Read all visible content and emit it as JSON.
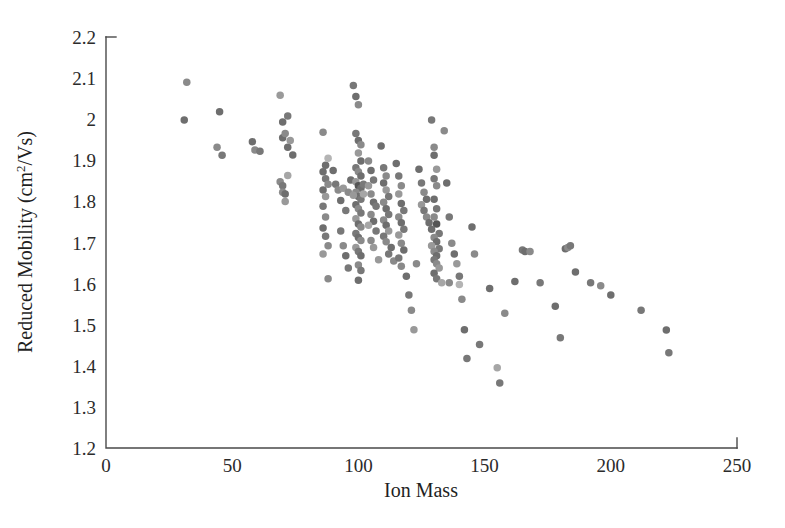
{
  "figure": {
    "background_color": "#ffffff",
    "axis_color": "#4a4a4a",
    "text_color": "#1f1f1f"
  },
  "chart_data": {
    "type": "scatter",
    "title": "",
    "xlabel": "Ion Mass",
    "ylabel": "Reduced Mobility (cm2/Vs)",
    "ylabel_parts": {
      "prefix": "Reduced Mobility (cm",
      "superscript": "2",
      "suffix": "/Vs)"
    },
    "xlim": [
      0,
      250
    ],
    "ylim": [
      1.2,
      2.2
    ],
    "xticks": [
      0,
      50,
      100,
      150,
      200,
      250
    ],
    "xtick_labels": [
      "0",
      "50",
      "100",
      "150",
      "200",
      "250"
    ],
    "yticks": [
      1.2,
      1.3,
      1.4,
      1.5,
      1.6,
      1.7,
      1.8,
      1.9,
      2.0,
      2.1,
      2.2
    ],
    "ytick_labels": [
      "1.2",
      "1.3",
      "1.4",
      "1.5",
      "1.6",
      "1.7",
      "1.8",
      "1.9",
      "2",
      "2.1",
      "2.2"
    ],
    "grid": false,
    "legend": false,
    "marker": {
      "shape": "circle",
      "size_px": 7.5,
      "palette": [
        "#6e6e6e",
        "#8a8a8a",
        "#555555",
        "#a6a6a6",
        "#787878",
        "#999999",
        "#636363",
        "#b4b4b4"
      ]
    },
    "n_points": 196,
    "points": [
      [
        32,
        2.09,
        "#8a8a8a"
      ],
      [
        31,
        1.998,
        "#6e6e6e"
      ],
      [
        45,
        2.018,
        "#6e6e6e"
      ],
      [
        44,
        1.932,
        "#8a8a8a"
      ],
      [
        46,
        1.912,
        "#787878"
      ],
      [
        58,
        1.945,
        "#6e6e6e"
      ],
      [
        59,
        1.925,
        "#8a8a8a"
      ],
      [
        61,
        1.922,
        "#787878"
      ],
      [
        69,
        2.058,
        "#9a9a9a"
      ],
      [
        70,
        1.993,
        "#6e6e6e"
      ],
      [
        70,
        1.955,
        "#6e6e6e"
      ],
      [
        71,
        1.965,
        "#8a8a8a"
      ],
      [
        72,
        2.008,
        "#787878"
      ],
      [
        72,
        1.932,
        "#6e6e6e"
      ],
      [
        73,
        1.948,
        "#999999"
      ],
      [
        74,
        1.913,
        "#6e6e6e"
      ],
      [
        69,
        1.848,
        "#8a8a8a"
      ],
      [
        70,
        1.838,
        "#787878"
      ],
      [
        70,
        1.822,
        "#8a8a8a"
      ],
      [
        71,
        1.818,
        "#6e6e6e"
      ],
      [
        71,
        1.8,
        "#999999"
      ],
      [
        72,
        1.863,
        "#a6a6a6"
      ],
      [
        86,
        1.968,
        "#8a8a8a"
      ],
      [
        87,
        1.888,
        "#6e6e6e"
      ],
      [
        88,
        1.905,
        "#b4b4b4"
      ],
      [
        86,
        1.872,
        "#6e6e6e"
      ],
      [
        87,
        1.855,
        "#787878"
      ],
      [
        88,
        1.842,
        "#8a8a8a"
      ],
      [
        86,
        1.828,
        "#6e6e6e"
      ],
      [
        87,
        1.812,
        "#999999"
      ],
      [
        86,
        1.788,
        "#787878"
      ],
      [
        87,
        1.762,
        "#8a8a8a"
      ],
      [
        86,
        1.735,
        "#6e6e6e"
      ],
      [
        87,
        1.715,
        "#787878"
      ],
      [
        88,
        1.692,
        "#8a8a8a"
      ],
      [
        86,
        1.672,
        "#999999"
      ],
      [
        88,
        1.612,
        "#8a8a8a"
      ],
      [
        90,
        1.875,
        "#6e6e6e"
      ],
      [
        91,
        1.842,
        "#787878"
      ],
      [
        92,
        1.828,
        "#8a8a8a"
      ],
      [
        93,
        1.802,
        "#6e6e6e"
      ],
      [
        94,
        1.832,
        "#999999"
      ],
      [
        95,
        1.778,
        "#787878"
      ],
      [
        96,
        1.822,
        "#8a8a8a"
      ],
      [
        97,
        1.852,
        "#6e6e6e"
      ],
      [
        98,
        2.082,
        "#787878"
      ],
      [
        99,
        2.055,
        "#6e6e6e"
      ],
      [
        100,
        2.035,
        "#8a8a8a"
      ],
      [
        99,
        1.965,
        "#787878"
      ],
      [
        100,
        1.948,
        "#6e6e6e"
      ],
      [
        101,
        1.938,
        "#8a8a8a"
      ],
      [
        100,
        1.918,
        "#999999"
      ],
      [
        101,
        1.898,
        "#6e6e6e"
      ],
      [
        99,
        1.882,
        "#787878"
      ],
      [
        100,
        1.872,
        "#8a8a8a"
      ],
      [
        101,
        1.862,
        "#6e6e6e"
      ],
      [
        99,
        1.848,
        "#999999"
      ],
      [
        100,
        1.838,
        "#555555"
      ],
      [
        101,
        1.832,
        "#6e6e6e"
      ],
      [
        102,
        1.842,
        "#787878"
      ],
      [
        99,
        1.822,
        "#8a8a8a"
      ],
      [
        100,
        1.812,
        "#6e6e6e"
      ],
      [
        101,
        1.805,
        "#787878"
      ],
      [
        98,
        1.815,
        "#999999"
      ],
      [
        102,
        1.818,
        "#a6a6a6"
      ],
      [
        99,
        1.792,
        "#6e6e6e"
      ],
      [
        100,
        1.782,
        "#8a8a8a"
      ],
      [
        101,
        1.772,
        "#787878"
      ],
      [
        99,
        1.758,
        "#999999"
      ],
      [
        100,
        1.745,
        "#6e6e6e"
      ],
      [
        101,
        1.738,
        "#8a8a8a"
      ],
      [
        99,
        1.722,
        "#787878"
      ],
      [
        100,
        1.712,
        "#6e6e6e"
      ],
      [
        101,
        1.705,
        "#8a8a8a"
      ],
      [
        99,
        1.688,
        "#999999"
      ],
      [
        100,
        1.678,
        "#787878"
      ],
      [
        101,
        1.668,
        "#6e6e6e"
      ],
      [
        100,
        1.645,
        "#8a8a8a"
      ],
      [
        101,
        1.632,
        "#787878"
      ],
      [
        100,
        1.608,
        "#6e6e6e"
      ],
      [
        104,
        1.898,
        "#8a8a8a"
      ],
      [
        105,
        1.875,
        "#6e6e6e"
      ],
      [
        106,
        1.852,
        "#787878"
      ],
      [
        104,
        1.838,
        "#999999"
      ],
      [
        105,
        1.818,
        "#8a8a8a"
      ],
      [
        106,
        1.798,
        "#6e6e6e"
      ],
      [
        107,
        1.788,
        "#787878"
      ],
      [
        105,
        1.768,
        "#8a8a8a"
      ],
      [
        106,
        1.752,
        "#6e6e6e"
      ],
      [
        104,
        1.742,
        "#a6a6a6"
      ],
      [
        107,
        1.728,
        "#787878"
      ],
      [
        105,
        1.705,
        "#8a8a8a"
      ],
      [
        106,
        1.688,
        "#999999"
      ],
      [
        109,
        1.935,
        "#6e6e6e"
      ],
      [
        110,
        1.882,
        "#787878"
      ],
      [
        111,
        1.862,
        "#8a8a8a"
      ],
      [
        110,
        1.845,
        "#6e6e6e"
      ],
      [
        111,
        1.828,
        "#999999"
      ],
      [
        112,
        1.812,
        "#787878"
      ],
      [
        110,
        1.798,
        "#8a8a8a"
      ],
      [
        111,
        1.782,
        "#6e6e6e"
      ],
      [
        112,
        1.768,
        "#787878"
      ],
      [
        110,
        1.755,
        "#8a8a8a"
      ],
      [
        111,
        1.742,
        "#6e6e6e"
      ],
      [
        112,
        1.728,
        "#999999"
      ],
      [
        110,
        1.715,
        "#787878"
      ],
      [
        111,
        1.702,
        "#8a8a8a"
      ],
      [
        113,
        1.688,
        "#6e6e6e"
      ],
      [
        112,
        1.672,
        "#787878"
      ],
      [
        114,
        1.655,
        "#8a8a8a"
      ],
      [
        115,
        1.892,
        "#6e6e6e"
      ],
      [
        116,
        1.862,
        "#787878"
      ],
      [
        117,
        1.838,
        "#8a8a8a"
      ],
      [
        116,
        1.818,
        "#999999"
      ],
      [
        117,
        1.795,
        "#6e6e6e"
      ],
      [
        118,
        1.778,
        "#787878"
      ],
      [
        116,
        1.762,
        "#8a8a8a"
      ],
      [
        117,
        1.748,
        "#6e6e6e"
      ],
      [
        118,
        1.732,
        "#787878"
      ],
      [
        116,
        1.718,
        "#999999"
      ],
      [
        117,
        1.698,
        "#8a8a8a"
      ],
      [
        118,
        1.682,
        "#6e6e6e"
      ],
      [
        116,
        1.662,
        "#787878"
      ],
      [
        117,
        1.642,
        "#8a8a8a"
      ],
      [
        119,
        1.618,
        "#6e6e6e"
      ],
      [
        120,
        1.572,
        "#787878"
      ],
      [
        121,
        1.535,
        "#8a8a8a"
      ],
      [
        122,
        1.488,
        "#999999"
      ],
      [
        124,
        1.878,
        "#6e6e6e"
      ],
      [
        125,
        1.845,
        "#787878"
      ],
      [
        126,
        1.822,
        "#8a8a8a"
      ],
      [
        127,
        1.805,
        "#6e6e6e"
      ],
      [
        125,
        1.792,
        "#999999"
      ],
      [
        126,
        1.778,
        "#787878"
      ],
      [
        127,
        1.762,
        "#8a8a8a"
      ],
      [
        128,
        1.748,
        "#6e6e6e"
      ],
      [
        129,
        1.998,
        "#787878"
      ],
      [
        130,
        1.932,
        "#8a8a8a"
      ],
      [
        130,
        1.912,
        "#6e6e6e"
      ],
      [
        131,
        1.878,
        "#999999"
      ],
      [
        130,
        1.855,
        "#787878"
      ],
      [
        131,
        1.838,
        "#8a8a8a"
      ],
      [
        130,
        1.805,
        "#6e6e6e"
      ],
      [
        131,
        1.782,
        "#787878"
      ],
      [
        130,
        1.762,
        "#8a8a8a"
      ],
      [
        131,
        1.745,
        "#555555"
      ],
      [
        129,
        1.732,
        "#6e6e6e"
      ],
      [
        132,
        1.722,
        "#787878"
      ],
      [
        130,
        1.712,
        "#8a8a8a"
      ],
      [
        131,
        1.702,
        "#6e6e6e"
      ],
      [
        129,
        1.692,
        "#999999"
      ],
      [
        132,
        1.685,
        "#787878"
      ],
      [
        130,
        1.678,
        "#8a8a8a"
      ],
      [
        131,
        1.668,
        "#6e6e6e"
      ],
      [
        130,
        1.658,
        "#787878"
      ],
      [
        131,
        1.648,
        "#8a8a8a"
      ],
      [
        132,
        1.638,
        "#999999"
      ],
      [
        130,
        1.625,
        "#6e6e6e"
      ],
      [
        131,
        1.612,
        "#787878"
      ],
      [
        133,
        1.602,
        "#a6a6a6"
      ],
      [
        135,
        1.845,
        "#6e6e6e"
      ],
      [
        136,
        1.762,
        "#787878"
      ],
      [
        137,
        1.698,
        "#8a8a8a"
      ],
      [
        138,
        1.672,
        "#6e6e6e"
      ],
      [
        139,
        1.648,
        "#999999"
      ],
      [
        140,
        1.618,
        "#787878"
      ],
      [
        140,
        1.598,
        "#b4b4b4"
      ],
      [
        141,
        1.562,
        "#8a8a8a"
      ],
      [
        142,
        1.488,
        "#6e6e6e"
      ],
      [
        143,
        1.418,
        "#787878"
      ],
      [
        136,
        1.602,
        "#8a8a8a"
      ],
      [
        145,
        1.738,
        "#6e6e6e"
      ],
      [
        146,
        1.672,
        "#8a8a8a"
      ],
      [
        148,
        1.452,
        "#787878"
      ],
      [
        152,
        1.588,
        "#6e6e6e"
      ],
      [
        155,
        1.395,
        "#a6a6a6"
      ],
      [
        156,
        1.358,
        "#787878"
      ],
      [
        158,
        1.528,
        "#8a8a8a"
      ],
      [
        162,
        1.605,
        "#6e6e6e"
      ],
      [
        165,
        1.682,
        "#787878"
      ],
      [
        166,
        1.678,
        "#6e6e6e"
      ],
      [
        168,
        1.678,
        "#8a8a8a"
      ],
      [
        172,
        1.602,
        "#787878"
      ],
      [
        178,
        1.545,
        "#6e6e6e"
      ],
      [
        180,
        1.468,
        "#787878"
      ],
      [
        182,
        1.685,
        "#6e6e6e"
      ],
      [
        183,
        1.688,
        "#8a8a8a"
      ],
      [
        184,
        1.692,
        "#787878"
      ],
      [
        186,
        1.628,
        "#6e6e6e"
      ],
      [
        192,
        1.602,
        "#787878"
      ],
      [
        196,
        1.595,
        "#8a8a8a"
      ],
      [
        200,
        1.572,
        "#6e6e6e"
      ],
      [
        212,
        1.535,
        "#787878"
      ],
      [
        222,
        1.487,
        "#6e6e6e"
      ],
      [
        223,
        1.432,
        "#787878"
      ],
      [
        134,
        1.972,
        "#8a8a8a"
      ],
      [
        93,
        1.728,
        "#787878"
      ],
      [
        94,
        1.692,
        "#8a8a8a"
      ],
      [
        95,
        1.668,
        "#6e6e6e"
      ],
      [
        96,
        1.638,
        "#787878"
      ],
      [
        108,
        1.658,
        "#999999"
      ],
      [
        123,
        1.648,
        "#8a8a8a"
      ]
    ]
  }
}
